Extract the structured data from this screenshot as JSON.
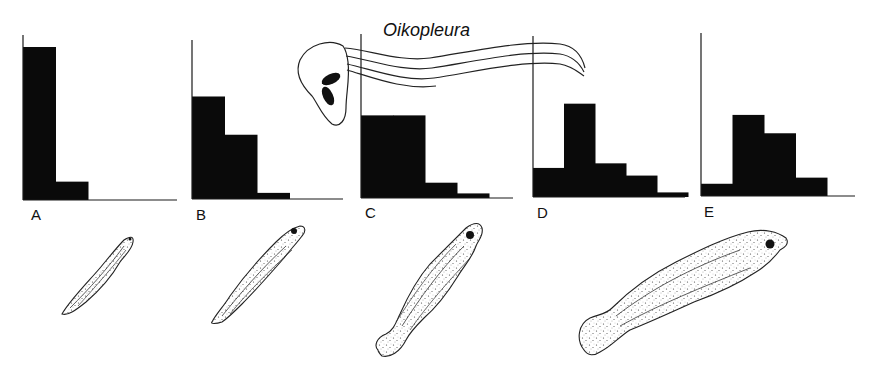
{
  "figure": {
    "title": "Oikopleura",
    "panel_labels": [
      "A",
      "B",
      "C",
      "D",
      "E"
    ]
  },
  "colors": {
    "bar": "#0a0a0a",
    "axis": "#1a1a1a",
    "stipple": "#333333",
    "background": "#ffffff"
  },
  "chart_data": [
    {
      "type": "bar",
      "title": "A",
      "categories": [
        "1",
        "2",
        "3",
        "4",
        "5"
      ],
      "values": [
        100,
        12,
        0,
        0,
        0
      ],
      "xlabel": "",
      "ylabel": "",
      "ylim": [
        0,
        110
      ],
      "grid": false,
      "note": "relative frequency of prey size classes (no tick labels shown)"
    },
    {
      "type": "bar",
      "title": "B",
      "categories": [
        "1",
        "2",
        "3",
        "4",
        "5"
      ],
      "values": [
        67,
        42,
        4,
        0,
        0
      ],
      "xlabel": "",
      "ylabel": "",
      "ylim": [
        0,
        110
      ],
      "grid": false
    },
    {
      "type": "bar",
      "title": "C",
      "categories": [
        "1",
        "2",
        "3",
        "4",
        "5"
      ],
      "values": [
        54,
        54,
        10,
        3,
        0
      ],
      "xlabel": "",
      "ylabel": "",
      "ylim": [
        0,
        110
      ],
      "grid": false
    },
    {
      "type": "bar",
      "title": "D",
      "categories": [
        "1",
        "2",
        "3",
        "4",
        "5"
      ],
      "values": [
        19,
        61,
        22,
        14,
        3
      ],
      "xlabel": "",
      "ylabel": "",
      "ylim": [
        0,
        110
      ],
      "grid": false
    },
    {
      "type": "bar",
      "title": "E",
      "categories": [
        "1",
        "2",
        "3",
        "4",
        "5"
      ],
      "values": [
        8,
        53,
        41,
        12,
        0
      ],
      "xlabel": "",
      "ylabel": "",
      "ylim": [
        0,
        110
      ],
      "grid": false
    }
  ],
  "illustrations": [
    {
      "name": "oikopleura-tunicate",
      "label": "Oikopleura"
    },
    {
      "name": "fish-larva-a"
    },
    {
      "name": "fish-larva-b"
    },
    {
      "name": "fish-larva-c"
    },
    {
      "name": "fish-larva-d"
    }
  ]
}
